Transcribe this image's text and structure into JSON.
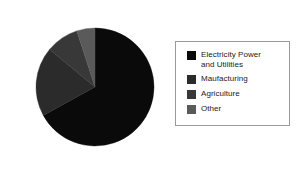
{
  "chart_data": {
    "type": "pie",
    "title": "",
    "subtitle": "",
    "xlabel": "",
    "ylabel": "",
    "grid": false,
    "legend_position": "right",
    "start_angle_deg": 0,
    "direction": "clockwise",
    "categories": [
      "Electricity Power and Utilities",
      "Maufacturing",
      "Agriculture",
      "Other"
    ],
    "values": [
      67,
      19,
      9,
      5
    ],
    "slices": [
      {
        "label": "Electricity Power and Utilities",
        "label_lines": "Electricity Power\nand Utilities",
        "value": 67,
        "start_deg": 0,
        "end_deg": 241.2,
        "color": "#0a0a0a"
      },
      {
        "label": "Maufacturing",
        "label_lines": "Maufacturing",
        "value": 19,
        "start_deg": 241.2,
        "end_deg": 309.6,
        "color": "#2b2b2b"
      },
      {
        "label": "Agriculture",
        "label_lines": "Agriculture",
        "value": 9,
        "start_deg": 309.6,
        "end_deg": 342.0,
        "color": "#383838"
      },
      {
        "label": "Other",
        "label_lines": "Other",
        "value": 5,
        "start_deg": 342.0,
        "end_deg": 360.0,
        "color": "#5a5a5a"
      }
    ]
  },
  "legend": {
    "border_color": "#9a9a9a",
    "entries": [
      {
        "label": "Electricity Power\nand Utilities",
        "color": "#0a0a0a"
      },
      {
        "label": "Maufacturing",
        "color": "#2b2b2b"
      },
      {
        "label": "Agriculture",
        "color": "#383838"
      },
      {
        "label": "Other",
        "color": "#5a5a5a"
      }
    ]
  },
  "canvas": {
    "background": "#ffffff",
    "pie_center_x": 95,
    "pie_center_y": 87,
    "pie_radius": 60
  }
}
